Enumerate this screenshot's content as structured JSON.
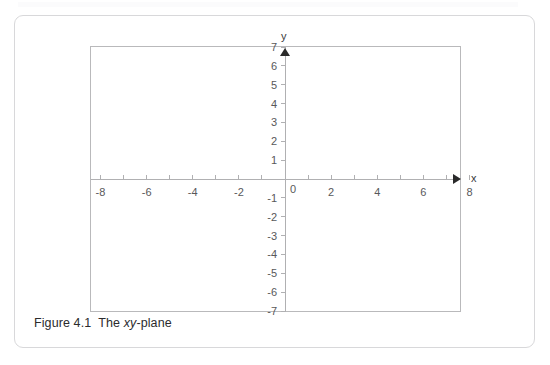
{
  "figure": {
    "caption_prefix": "Figure 4.1",
    "caption_article": "The",
    "caption_italic": "xy",
    "caption_suffix": "-plane",
    "card_border_color": "#d8d8da",
    "frame_border_color": "#b9b9bb",
    "axis_color": "#b0b0b2",
    "arrow_color": "#2a2a2a",
    "label_color": "#58585a"
  },
  "chart_data": {
    "type": "scatter",
    "title": "",
    "subtitle": "",
    "xlabel": "x",
    "ylabel": "y",
    "xlim": [
      -8,
      8
    ],
    "ylim": [
      -7,
      7
    ],
    "grid": false,
    "legend": null,
    "series": [],
    "x_ticks": [
      -8,
      -6,
      -4,
      -2,
      0,
      2,
      4,
      6,
      8
    ],
    "x_tick_labels": [
      "-8",
      "-6",
      "-4",
      "-2",
      "0",
      "2",
      "4",
      "6",
      "8"
    ],
    "x_minor_ticks": [
      -7,
      -5,
      -3,
      -1,
      1,
      3,
      5,
      7
    ],
    "y_ticks": [
      7,
      6,
      5,
      4,
      3,
      2,
      1,
      -1,
      -2,
      -3,
      -4,
      -5,
      -6,
      -7
    ],
    "y_tick_labels": [
      "7",
      "6",
      "5",
      "4",
      "3",
      "2",
      "1",
      "-1",
      "-2",
      "-3",
      "-4",
      "-5",
      "-6",
      "-7"
    ],
    "origin_label": "0",
    "x_axis_arrow": true,
    "y_axis_arrow": true,
    "annotations": []
  }
}
